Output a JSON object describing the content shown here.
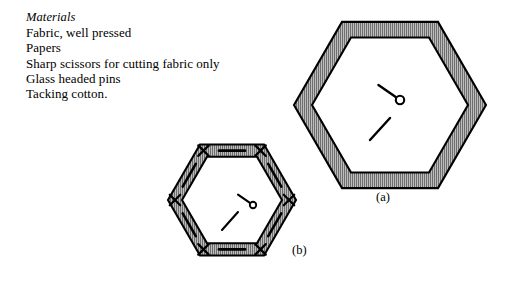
{
  "document": {
    "background_color": "#ffffff",
    "ink_color": "#000000"
  },
  "materials": {
    "heading": "Materials",
    "items": [
      "Fabric, well pressed",
      "Papers",
      "Sharp scissors for cutting fabric only",
      "Glass headed pins",
      "Tacking cotton."
    ]
  },
  "figures": [
    {
      "id": "figure-a",
      "label": "(a)",
      "description": "large hexagon patchwork piece with folded fabric border and a glass headed pin",
      "fill_color": "#a8a8a8",
      "outline_color": "#000000",
      "hatch": "vertical",
      "center": {
        "x": 390,
        "y": 105
      },
      "outer_radius": 96,
      "inner_radius": 78,
      "has_tacking_stitches": false,
      "pin": {
        "x": 400,
        "y": 100,
        "head_radius": 4.2,
        "angle_deg": 215
      },
      "thread_tail": {
        "x1": 370,
        "y1": 140,
        "x2": 390,
        "y2": 118
      }
    },
    {
      "id": "figure-b",
      "label": "(b)",
      "description": "smaller hexagon patchwork piece tacked to paper with cross stitches at corners",
      "fill_color": "#a8a8a8",
      "outline_color": "#000000",
      "hatch": "vertical",
      "center": {
        "x": 232,
        "y": 200
      },
      "outer_radius": 64,
      "inner_radius": 50,
      "has_tacking_stitches": true,
      "pin": {
        "x": 253,
        "y": 205,
        "head_radius": 3.2,
        "angle_deg": 215
      },
      "thread_tail": {
        "x1": 222,
        "y1": 230,
        "x2": 238,
        "y2": 212
      }
    }
  ]
}
